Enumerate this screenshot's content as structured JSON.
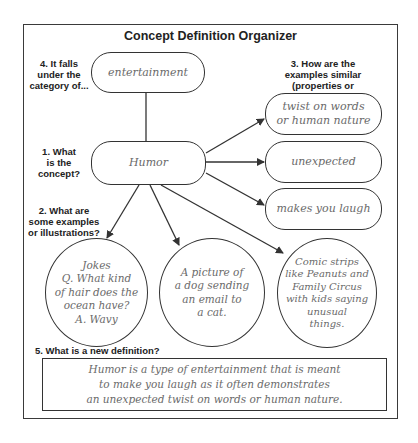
{
  "title": "Concept Definition Organizer",
  "questions": {
    "q1": "1. What\nis the\nconcept?",
    "q2": "2. What are\nsome examples\nor illustrations?",
    "q3": "3. How are the\nexamples similar\n(properties or characteristics)?",
    "q4": "4. It falls\nunder the\ncategory of...",
    "q5": "5. What is a new definition?"
  },
  "category": "entertainment",
  "concept": "Humor",
  "characteristics": [
    "twist on words\nor human nature",
    "unexpected",
    "makes you laugh"
  ],
  "examples": [
    "Jokes\nQ. What kind\nof hair does the\nocean have?\nA. Wavy",
    "A picture of\na dog sending\nan email to\na cat.",
    "Comic strips\nlike Peanuts and\nFamily Circus\nwith kids saying\nunusual\nthings."
  ],
  "definition": "Humor is a type of entertainment that is meant\nto make you laugh as it often demonstrates\nan unexpected twist on words or human nature.",
  "colors": {
    "line": "#333333",
    "handwriting": "#6a6a6a",
    "label": "#222222"
  }
}
